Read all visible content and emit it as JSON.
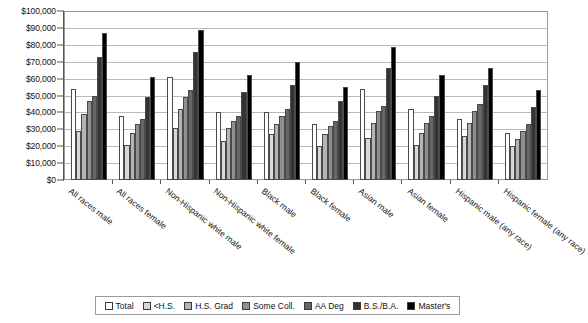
{
  "chart_data": {
    "type": "bar",
    "title": "",
    "subtitle": "",
    "xlabel": "",
    "ylabel": "",
    "ylim": [
      0,
      100000
    ],
    "ytick_values": [
      0,
      10000,
      20000,
      30000,
      40000,
      50000,
      60000,
      70000,
      80000,
      90000,
      100000
    ],
    "ytick_labels": [
      "$0",
      "$10,000",
      "$20,000",
      "$30,000",
      "$40,000",
      "$50,000",
      "$60,000",
      "$70,000",
      "$80,000",
      "$90,000",
      "$100,000"
    ],
    "grid": true,
    "legend_position": "bottom",
    "categories": [
      "All races male",
      "All races female",
      "Non-Hispanic white male",
      "Non-Hispanic white female",
      "Black male",
      "Black female",
      "Asian male",
      "Asian female",
      "Hispanic male (any race)",
      "Hispanic female (any race)"
    ],
    "series": [
      {
        "name": "Total",
        "color": "#ffffff",
        "values": [
          54000,
          38000,
          61000,
          40000,
          40000,
          33000,
          54000,
          42000,
          36000,
          28000
        ]
      },
      {
        "name": "<H.S.",
        "color": "#d8d8d8",
        "values": [
          29000,
          21000,
          31000,
          23000,
          27000,
          20000,
          25000,
          21000,
          26000,
          20000
        ]
      },
      {
        "name": "H.S. Grad",
        "color": "#b4b4b4",
        "values": [
          39000,
          28000,
          42000,
          31000,
          33000,
          27000,
          34000,
          28000,
          34000,
          24000
        ]
      },
      {
        "name": "Some Coll.",
        "color": "#8f8f8f",
        "values": [
          47000,
          33000,
          49000,
          35000,
          38000,
          32000,
          41000,
          34000,
          41000,
          29000
        ]
      },
      {
        "name": "AA Deg",
        "color": "#666666",
        "values": [
          50000,
          36000,
          53000,
          38000,
          42000,
          35000,
          44000,
          38000,
          45000,
          33000
        ]
      },
      {
        "name": "B.S./B.A.",
        "color": "#333333",
        "values": [
          73000,
          49000,
          76000,
          52000,
          56000,
          47000,
          66000,
          50000,
          56000,
          43000
        ]
      },
      {
        "name": "Master's",
        "color": "#000000",
        "values": [
          87000,
          61000,
          89000,
          62000,
          70000,
          55000,
          79000,
          62000,
          66000,
          53000
        ]
      }
    ]
  }
}
